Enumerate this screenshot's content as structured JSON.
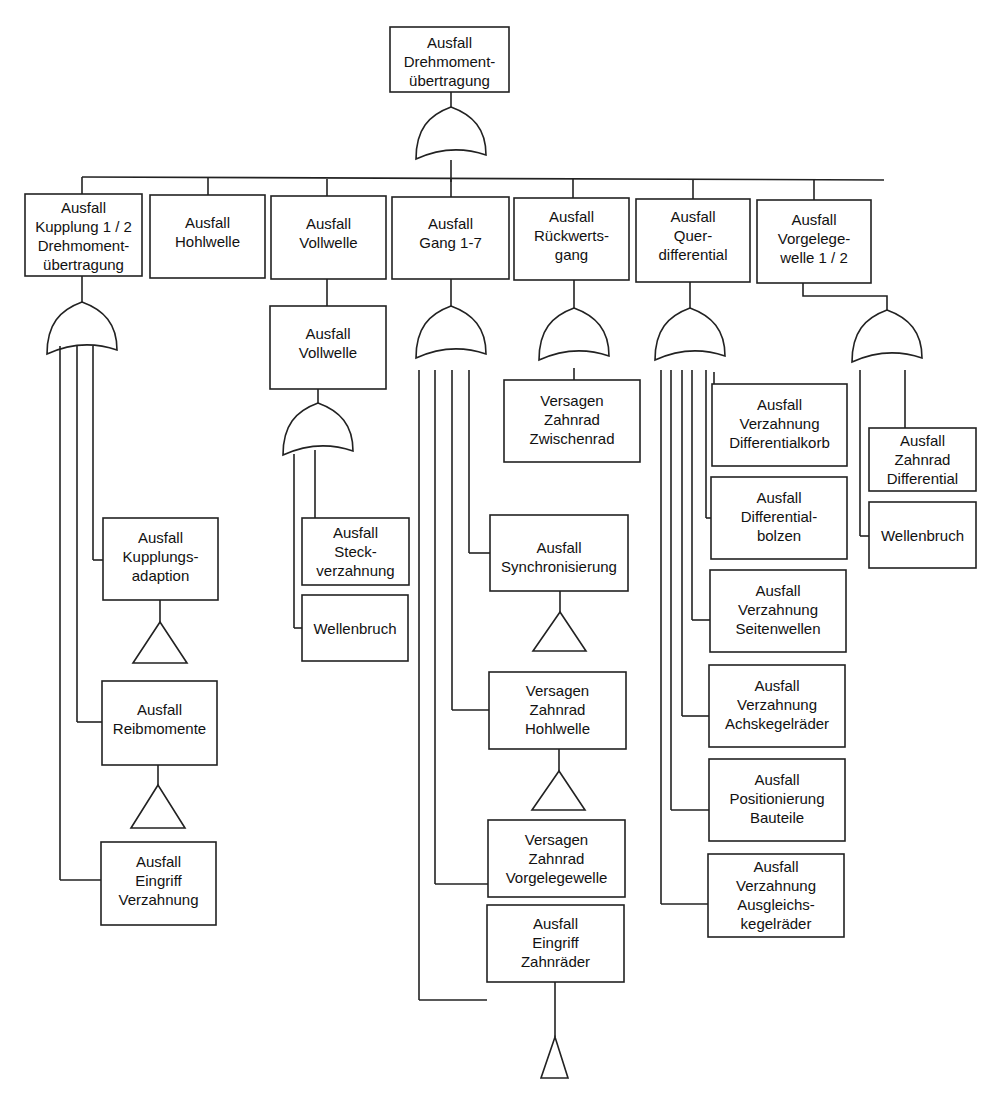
{
  "diagram": {
    "type": "fault-tree",
    "top_event": {
      "lines": [
        "Ausfall",
        "Drehmoment-",
        "übertragung"
      ]
    },
    "level1": [
      {
        "lines": [
          "Ausfall",
          "Kupplung 1 / 2",
          "Drehmoment-",
          "übertragung"
        ]
      },
      {
        "lines": [
          "Ausfall",
          "Hohlwelle"
        ]
      },
      {
        "lines": [
          "Ausfall",
          "Vollwelle"
        ]
      },
      {
        "lines": [
          "Ausfall",
          "Gang 1-7"
        ]
      },
      {
        "lines": [
          "Ausfall",
          "Rückwerts-",
          "gang"
        ]
      },
      {
        "lines": [
          "Ausfall",
          "Quer-",
          "differential"
        ]
      },
      {
        "lines": [
          "Ausfall",
          "Vorgelege-",
          "welle 1 / 2"
        ]
      }
    ],
    "kupplung_children": [
      {
        "lines": [
          "Ausfall",
          "Kupplungs-",
          "adaption"
        ]
      },
      {
        "lines": [
          "Ausfall",
          "Reibmomente"
        ]
      },
      {
        "lines": [
          "Ausfall",
          "Eingriff",
          "Verzahnung"
        ]
      }
    ],
    "vollwelle_sub": {
      "lines": [
        "Ausfall",
        "Vollwelle"
      ]
    },
    "vollwelle_children": [
      {
        "lines": [
          "Ausfall",
          "Steck-",
          "verzahnung"
        ]
      },
      {
        "lines": [
          "Wellenbruch"
        ]
      }
    ],
    "gang_children": [
      {
        "lines": [
          "Ausfall",
          "Synchronisierung"
        ]
      },
      {
        "lines": [
          "Versagen",
          "Zahnrad",
          "Hohlwelle"
        ]
      },
      {
        "lines": [
          "Versagen",
          "Zahnrad",
          "Vorgelegewelle"
        ]
      },
      {
        "lines": [
          "Ausfall",
          "Eingriff",
          "Zahnräder"
        ]
      }
    ],
    "rueckwerts_children": [
      {
        "lines": [
          "Versagen",
          "Zahnrad",
          "Zwischenrad"
        ]
      }
    ],
    "differential_children": [
      {
        "lines": [
          "Ausfall",
          "Verzahnung",
          "Differentialkorb"
        ]
      },
      {
        "lines": [
          "Ausfall",
          "Differential-",
          "bolzen"
        ]
      },
      {
        "lines": [
          "Ausfall",
          "Verzahnung",
          "Seitenwellen"
        ]
      },
      {
        "lines": [
          "Ausfall",
          "Verzahnung",
          "Achskegelräder"
        ]
      },
      {
        "lines": [
          "Ausfall",
          "Positionierung",
          "Bauteile"
        ]
      },
      {
        "lines": [
          "Ausfall",
          "Verzahnung",
          "Ausgleichs-",
          "kegelräder"
        ]
      }
    ],
    "vorgelege_children": [
      {
        "lines": [
          "Ausfall",
          "Zahnrad",
          "Differential"
        ]
      },
      {
        "lines": [
          "Wellenbruch"
        ]
      }
    ],
    "gate_symbol": "or-gate",
    "transfer_symbol": "triangle-transfer"
  }
}
